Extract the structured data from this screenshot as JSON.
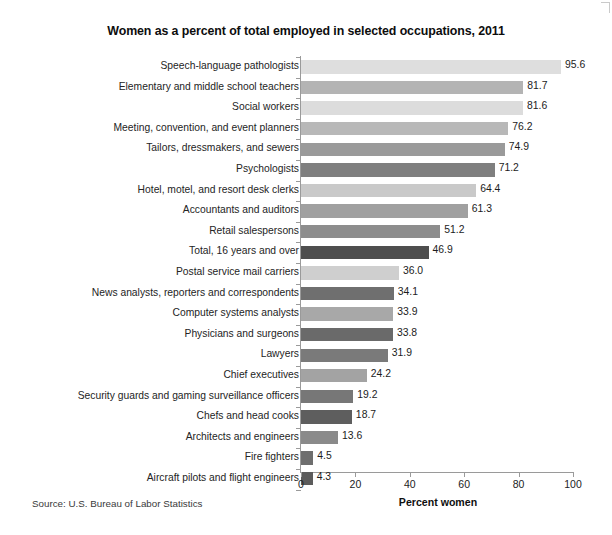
{
  "chart_data": {
    "type": "bar",
    "orientation": "horizontal",
    "title": "Women as a percent of total employed in selected occupations, 2011",
    "xlabel": "Percent women",
    "ylabel": "",
    "xlim": [
      0,
      100
    ],
    "xticks": [
      0,
      20,
      40,
      60,
      80,
      100
    ],
    "grid": false,
    "legend": null,
    "source": "Source: U.S. Bureau of Labor Statistics",
    "categories": [
      "Speech-language pathologists",
      "Elementary and middle school teachers",
      "Social workers",
      "Meeting, convention, and event planners",
      "Tailors, dressmakers, and sewers",
      "Psychologists",
      "Hotel, motel, and resort desk clerks",
      "Accountants and auditors",
      "Retail salespersons",
      "Total, 16 years and over",
      "Postal service mail carriers",
      "News analysts, reporters and correspondents",
      "Computer systems analysts",
      "Physicians and surgeons",
      "Lawyers",
      "Chief executives",
      "Security guards and gaming surveillance officers",
      "Chefs and head cooks",
      "Architects and engineers",
      "Fire fighters",
      "Aircraft pilots and flight engineers"
    ],
    "values": [
      95.6,
      81.7,
      81.6,
      76.2,
      74.9,
      71.2,
      64.4,
      61.3,
      51.2,
      46.9,
      36.0,
      34.1,
      33.9,
      33.8,
      31.9,
      24.2,
      19.2,
      18.7,
      13.6,
      4.5,
      4.3
    ],
    "value_labels": [
      "95.6",
      "81.7",
      "81.6",
      "76.2",
      "74.9",
      "71.2",
      "64.4",
      "61.3",
      "51.2",
      "46.9",
      "36.0",
      "34.1",
      "33.9",
      "33.8",
      "31.9",
      "24.2",
      "19.2",
      "18.7",
      "13.6",
      "4.5",
      "4.3"
    ],
    "bar_colors": [
      "#dedede",
      "#b4b4b4",
      "#dcdcdc",
      "#b8b8b8",
      "#9a9a9a",
      "#7f7f7f",
      "#c9c9c9",
      "#a0a0a0",
      "#8d8d8d",
      "#4e4e4e",
      "#cfcfcf",
      "#6f6f6f",
      "#a8a8a8",
      "#6a6a6a",
      "#7a7a7a",
      "#a3a3a3",
      "#777777",
      "#5e5e5e",
      "#8a8a8a",
      "#6e6e6e",
      "#5c5c5c"
    ],
    "highlight_category": "Total, 16 years and over",
    "highlight_color": "#4e4e4e",
    "axis_color": "#9a9a9a"
  }
}
